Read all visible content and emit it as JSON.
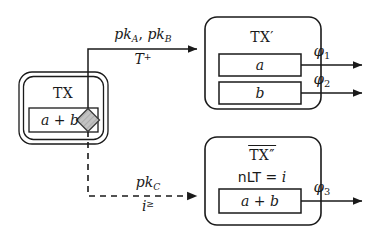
{
  "figure": {
    "type": "transaction-state-transition-diagram",
    "background_color": "#ffffff",
    "stroke_color": "#1a1a1a",
    "diamond_fill": "#b8b8b8"
  },
  "nodes": {
    "tx": {
      "title": "TX",
      "cell": "a + b",
      "marker": "diamond",
      "border_style": "double-rounded"
    },
    "tx_prime": {
      "title": "TX",
      "title_prime": "′",
      "cells": [
        {
          "label": "a"
        },
        {
          "label": "b"
        }
      ]
    },
    "tx_double_prime": {
      "title": "TX",
      "title_prime": "″",
      "title_overline": true,
      "condition_key": "nLT",
      "condition_eq": "=",
      "condition_value": "i",
      "cells": [
        {
          "label": "a + b"
        }
      ]
    }
  },
  "edges": [
    {
      "id": "edge-solid",
      "style": "solid",
      "from": "tx",
      "to": "tx_prime",
      "label_top_parts": [
        "pk",
        "A",
        ", ",
        "pk",
        "B"
      ],
      "label_top_text": "pk_A, pk_B",
      "label_bottom_base": "T",
      "label_bottom_sup": "+"
    },
    {
      "id": "edge-dashed",
      "style": "dashed",
      "from": "tx",
      "to": "tx_double_prime",
      "label_top_base": "pk",
      "label_top_sub": "C",
      "label_top_text": "pk_C",
      "label_bottom_base": "i",
      "label_bottom_sup": "≥"
    }
  ],
  "outputs": [
    {
      "id": "phi1",
      "base": "φ",
      "sub": "1",
      "source": "tx_prime.cells.0"
    },
    {
      "id": "phi2",
      "base": "φ",
      "sub": "2",
      "source": "tx_prime.cells.1"
    },
    {
      "id": "phi3",
      "base": "φ",
      "sub": "3",
      "source": "tx_double_prime.cells.0"
    }
  ]
}
